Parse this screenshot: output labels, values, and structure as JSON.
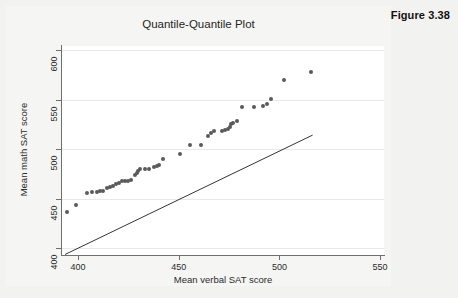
{
  "figure": {
    "label": "Figure 3.38"
  },
  "chart_data": {
    "type": "scatter",
    "title": "Quantile-Quantile Plot",
    "xlabel": "Mean verbal SAT score",
    "ylabel": "Mean math SAT score",
    "xlim": [
      392,
      552
    ],
    "ylim": [
      393,
      604
    ],
    "xticks": [
      400,
      450,
      500,
      550
    ],
    "yticks": [
      400,
      450,
      500,
      550,
      600
    ],
    "grid": true,
    "legend": null,
    "point_color": "#5a5a5e",
    "line_color": "#33333a",
    "series": [
      {
        "name": "Quantile pairs",
        "marker": "filled-circle",
        "points": [
          [
            394.5,
            436
          ],
          [
            399.0,
            444
          ],
          [
            404.5,
            456
          ],
          [
            407.0,
            457
          ],
          [
            409.5,
            457
          ],
          [
            411.0,
            458
          ],
          [
            412.5,
            458
          ],
          [
            414.5,
            461
          ],
          [
            416.0,
            462
          ],
          [
            417.5,
            463
          ],
          [
            419.0,
            465
          ],
          [
            420.5,
            466
          ],
          [
            422.0,
            468
          ],
          [
            423.5,
            468
          ],
          [
            425.0,
            468
          ],
          [
            426.5,
            469
          ],
          [
            428.0,
            474
          ],
          [
            429.0,
            476
          ],
          [
            429.8,
            478
          ],
          [
            430.5,
            480
          ],
          [
            433.0,
            480
          ],
          [
            435.0,
            480
          ],
          [
            437.5,
            482
          ],
          [
            439.0,
            483
          ],
          [
            440.0,
            484
          ],
          [
            442.0,
            490
          ],
          [
            450.5,
            495
          ],
          [
            455.5,
            504
          ],
          [
            461.0,
            504
          ],
          [
            464.5,
            513
          ],
          [
            466.0,
            516
          ],
          [
            467.5,
            518
          ],
          [
            471.5,
            518
          ],
          [
            473.0,
            519
          ],
          [
            474.5,
            520
          ],
          [
            475.5,
            522
          ],
          [
            476.0,
            525
          ],
          [
            477.0,
            526
          ],
          [
            479.0,
            528
          ],
          [
            481.5,
            542
          ],
          [
            487.5,
            542
          ],
          [
            492.0,
            543
          ],
          [
            494.0,
            545
          ],
          [
            496.0,
            551
          ],
          [
            502.5,
            570
          ],
          [
            515.5,
            578
          ]
        ]
      }
    ],
    "reference_line": {
      "name": "45-degree reference line",
      "x0": 393.5,
      "y0": 393.5,
      "x1": 516.5,
      "y1": 514.0
    }
  }
}
